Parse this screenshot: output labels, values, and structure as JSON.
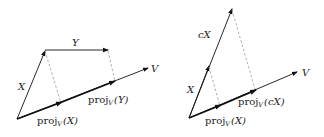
{
  "diagrams": [
    {
      "name": "projection-additivity",
      "labels": {
        "X": "X",
        "Y": "Y",
        "V": "V",
        "projX": {
          "base": "proj",
          "sub": "V",
          "arg": "(X)"
        },
        "projY": {
          "base": "proj",
          "sub": "V",
          "arg": "(Y)"
        }
      }
    },
    {
      "name": "projection-homogeneity",
      "labels": {
        "X": "X",
        "cX": "cX",
        "V": "V",
        "projX": {
          "base": "proj",
          "sub": "V",
          "arg": "(X)"
        },
        "projcX": {
          "base": "proj",
          "sub": "V",
          "arg": "(cX)"
        }
      }
    }
  ],
  "colors": {
    "vector": "#111111",
    "dashed": "#9a9a9a",
    "text": "#222222"
  }
}
